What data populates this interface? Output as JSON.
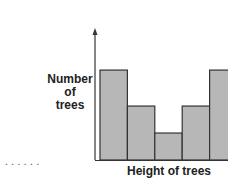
{
  "chart_data": {
    "type": "bar",
    "title": "",
    "xlabel": "Height of trees",
    "ylabel": "Number of trees",
    "categories": [
      "1",
      "2",
      "3",
      "4",
      "5"
    ],
    "values": [
      10,
      6,
      3,
      6,
      10
    ],
    "ylim": [
      0,
      12
    ],
    "grid": false,
    "legend": null,
    "style": {
      "bar_fill": "#b7b7b7",
      "bar_edge": "#333333",
      "bar_gap": 0
    }
  },
  "labels": {
    "ylabel_lines": [
      "Number",
      "of",
      "trees"
    ],
    "xlabel": "Height of trees",
    "dots": "......"
  }
}
